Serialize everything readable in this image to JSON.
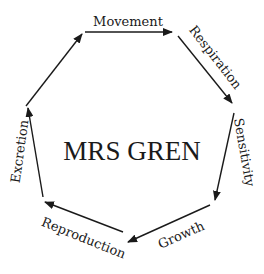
{
  "diagram": {
    "title": "MRS GREN",
    "stroke_color": "#1a1a1a",
    "background": "#ffffff",
    "stages": [
      {
        "label": "Movement"
      },
      {
        "label": "Respiration"
      },
      {
        "label": "Sensitivity"
      },
      {
        "label": "Growth"
      },
      {
        "label": "Reproduction"
      },
      {
        "label": "Excretion"
      }
    ]
  }
}
